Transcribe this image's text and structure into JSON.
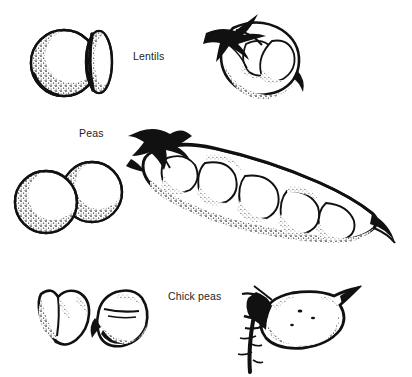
{
  "figure": {
    "kind": "botanical-line-drawing-plate",
    "background_color": "#ffffff",
    "ink_color": "#111111",
    "text_color": "#232323",
    "width": 412,
    "height": 377,
    "caption_rows": [
      {
        "label": "Lentils",
        "seeds_view": "one round face-on seed and one narrow edge-on lens-shaped seed",
        "pod_view": "short plump two-seeded pod with dark spiky calyx at the stalk end"
      },
      {
        "label": "Peas",
        "seeds_view": "two overlapping round stippled seeds",
        "pod_view": "long curved pod opened to show five round peas, dark calyx at stalk end and a tapering pointed tip"
      },
      {
        "label": "Chick peas",
        "seeds_view": "two beaked angular seeds",
        "pod_view": "single inflated oval pod with pointed tip on a bristly hairy stem"
      }
    ]
  },
  "labels": {
    "lentils": "Lentils",
    "peas": "Peas",
    "chickpeas": "Chick peas"
  }
}
